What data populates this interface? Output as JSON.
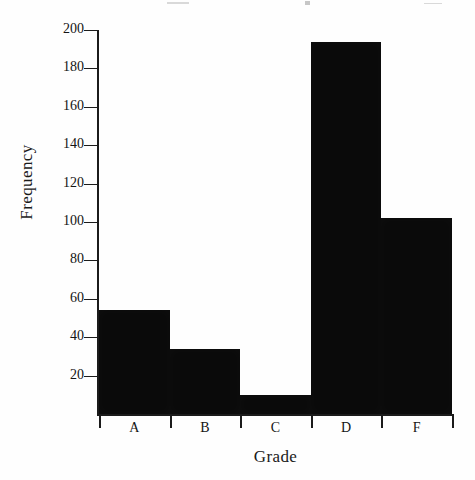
{
  "chart_data": {
    "type": "bar",
    "title": "",
    "subtitle": "",
    "xlabel": "Grade",
    "ylabel": "Frequency",
    "categories": [
      "A",
      "B",
      "C",
      "D",
      "F"
    ],
    "values": [
      54,
      34,
      10,
      194,
      102
    ],
    "ylim": [
      0,
      200
    ],
    "ytick_labels": [
      "200",
      "180",
      "160",
      "140",
      "120",
      "100",
      "80",
      "60",
      "40",
      "20"
    ],
    "ytick_values": [
      200,
      180,
      160,
      140,
      120,
      100,
      80,
      60,
      40,
      20
    ],
    "grid": false,
    "legend": false,
    "bar_color": "#0a0a0a",
    "axis_color": "#1b1b1b",
    "background": "#fefefe",
    "style": "histogram-contiguous-bars"
  }
}
